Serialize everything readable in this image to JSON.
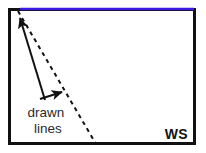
{
  "figure": {
    "background_color": "#ffffff",
    "frame": {
      "name": "panel border",
      "color": "#111111",
      "stroke_width": 3,
      "x": 8,
      "y": 8,
      "width": 188,
      "height": 137
    },
    "highlight_line": {
      "name": "blue top edge highlight",
      "color": "#3a1ae0",
      "stroke_width": 2.5,
      "x1": 20,
      "y1": 9,
      "x2": 194,
      "y2": 9
    },
    "dashed_line": {
      "name": "drawn dashed line",
      "color": "#111111",
      "stroke_width": 2,
      "dash_pattern": "4 4",
      "x1": 18,
      "y1": 11,
      "x2": 96,
      "y2": 144
    },
    "arrows": [
      {
        "id": "arrow-to-top-edge",
        "label": "long arrow pointing to top blue line",
        "x1": 45,
        "y1": 100,
        "x2": 20,
        "y2": 18,
        "color": "#111111",
        "stroke_width": 2
      },
      {
        "id": "arrow-to-dashed-line",
        "label": "short arrow pointing to dashed line",
        "x1": 40,
        "y1": 99,
        "x2": 62,
        "y2": 92,
        "color": "#111111",
        "stroke_width": 2
      }
    ],
    "caption": {
      "name": "drawn lines caption",
      "line1": "drawn",
      "line2": "lines",
      "color": "#2b2b2b",
      "x1": 46,
      "y1": 117,
      "x2": 48,
      "y2": 133
    },
    "corner_label": {
      "name": "WS watermark",
      "text": "WS",
      "color": "#111111",
      "x": 188,
      "y": 139
    }
  }
}
